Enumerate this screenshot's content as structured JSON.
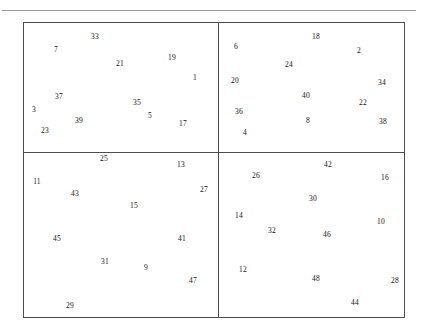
{
  "figure": {
    "frame_color": "#4d4d4d",
    "rule_color": "#9a9a9a",
    "label_color": "#111111",
    "background": "#ffffff",
    "panels": [
      {
        "name": "top-left"
      },
      {
        "name": "top-right"
      },
      {
        "name": "bottom-left"
      },
      {
        "name": "bottom-right"
      }
    ]
  },
  "chart_data": {
    "type": "scatter",
    "title": "",
    "xlabel": "",
    "ylabel": "",
    "grid": false,
    "legend": "none",
    "note": "Each data point is rendered only as its numeric text label; 48 labels total distributed across four rectangular panels.",
    "panels": [
      {
        "name": "top-left",
        "bounds_px": {
          "x": 23,
          "y": 22,
          "width": 195,
          "height": 130
        },
        "points": [
          {
            "label": "33",
            "x": 95,
            "y": 37
          },
          {
            "label": "7",
            "x": 56,
            "y": 50
          },
          {
            "label": "21",
            "x": 120,
            "y": 64
          },
          {
            "label": "19",
            "x": 172,
            "y": 58
          },
          {
            "label": "1",
            "x": 195,
            "y": 78
          },
          {
            "label": "37",
            "x": 59,
            "y": 97
          },
          {
            "label": "35",
            "x": 137,
            "y": 103
          },
          {
            "label": "3",
            "x": 34,
            "y": 110
          },
          {
            "label": "5",
            "x": 150,
            "y": 116
          },
          {
            "label": "39",
            "x": 79,
            "y": 121
          },
          {
            "label": "17",
            "x": 183,
            "y": 124
          },
          {
            "label": "23",
            "x": 45,
            "y": 131
          }
        ]
      },
      {
        "name": "top-right",
        "bounds_px": {
          "x": 218,
          "y": 22,
          "width": 187,
          "height": 130
        },
        "points": [
          {
            "label": "18",
            "x": 316,
            "y": 37
          },
          {
            "label": "6",
            "x": 236,
            "y": 47
          },
          {
            "label": "2",
            "x": 359,
            "y": 51
          },
          {
            "label": "24",
            "x": 289,
            "y": 65
          },
          {
            "label": "20",
            "x": 235,
            "y": 81
          },
          {
            "label": "34",
            "x": 382,
            "y": 83
          },
          {
            "label": "40",
            "x": 306,
            "y": 96
          },
          {
            "label": "22",
            "x": 363,
            "y": 103
          },
          {
            "label": "36",
            "x": 239,
            "y": 112
          },
          {
            "label": "8",
            "x": 308,
            "y": 121
          },
          {
            "label": "38",
            "x": 383,
            "y": 122
          },
          {
            "label": "4",
            "x": 245,
            "y": 133
          }
        ]
      },
      {
        "name": "bottom-left",
        "bounds_px": {
          "x": 23,
          "y": 152,
          "width": 195,
          "height": 166
        },
        "points": [
          {
            "label": "25",
            "x": 104,
            "y": 159
          },
          {
            "label": "13",
            "x": 181,
            "y": 165
          },
          {
            "label": "11",
            "x": 37,
            "y": 182
          },
          {
            "label": "43",
            "x": 75,
            "y": 194
          },
          {
            "label": "27",
            "x": 204,
            "y": 190
          },
          {
            "label": "15",
            "x": 134,
            "y": 206
          },
          {
            "label": "45",
            "x": 57,
            "y": 239
          },
          {
            "label": "41",
            "x": 182,
            "y": 239
          },
          {
            "label": "31",
            "x": 105,
            "y": 262
          },
          {
            "label": "9",
            "x": 146,
            "y": 268
          },
          {
            "label": "47",
            "x": 193,
            "y": 281
          },
          {
            "label": "29",
            "x": 70,
            "y": 306
          }
        ]
      },
      {
        "name": "bottom-right",
        "bounds_px": {
          "x": 218,
          "y": 152,
          "width": 187,
          "height": 166
        },
        "points": [
          {
            "label": "42",
            "x": 328,
            "y": 165
          },
          {
            "label": "26",
            "x": 256,
            "y": 176
          },
          {
            "label": "16",
            "x": 385,
            "y": 178
          },
          {
            "label": "30",
            "x": 313,
            "y": 199
          },
          {
            "label": "14",
            "x": 239,
            "y": 216
          },
          {
            "label": "10",
            "x": 381,
            "y": 222
          },
          {
            "label": "32",
            "x": 272,
            "y": 231
          },
          {
            "label": "46",
            "x": 327,
            "y": 235
          },
          {
            "label": "12",
            "x": 243,
            "y": 270
          },
          {
            "label": "48",
            "x": 316,
            "y": 279
          },
          {
            "label": "28",
            "x": 395,
            "y": 281
          },
          {
            "label": "44",
            "x": 355,
            "y": 303
          }
        ]
      }
    ]
  }
}
